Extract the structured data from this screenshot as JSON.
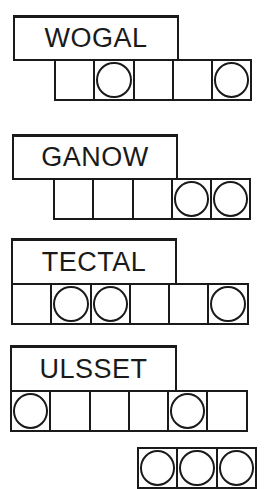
{
  "puzzles": [
    {
      "scrambled_word": "WOGAL",
      "cell_count": 5,
      "circled_cells": [
        2,
        5
      ]
    },
    {
      "scrambled_word": "GANOW",
      "cell_count": 5,
      "circled_cells": [
        4,
        5
      ]
    },
    {
      "scrambled_word": "TECTAL",
      "cell_count": 6,
      "circled_cells": [
        2,
        3,
        6
      ]
    },
    {
      "scrambled_word": "ULSSET",
      "cell_count": 6,
      "circled_cells": [
        1,
        5
      ]
    }
  ],
  "answer_row": {
    "cell_count": 3,
    "circled_cells": [
      1,
      2,
      3
    ]
  }
}
